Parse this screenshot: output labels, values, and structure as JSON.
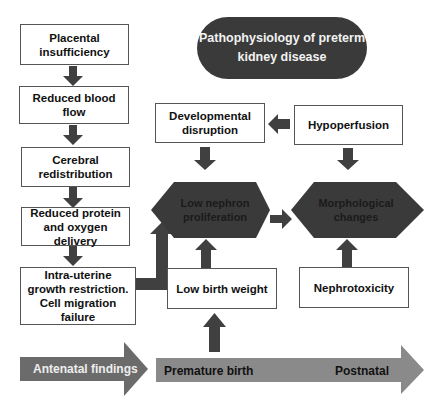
{
  "title": "Pathophysiology of preterm kidney disease",
  "colors": {
    "dark": "#3a3a3a",
    "arrow": "#404040",
    "timeline_antenatal": "#6b6b6b",
    "timeline_postnatal": "#8a8a8a",
    "box_border": "#555555",
    "background": "#ffffff"
  },
  "left_column": [
    {
      "label": "Placental insufficiency"
    },
    {
      "label": "Reduced blood flow"
    },
    {
      "label": "Cerebral redistribution"
    },
    {
      "label": "Reduced protein and oxygen delivery"
    },
    {
      "label": "Intra-uterine growth restriction. Cell migration failure"
    }
  ],
  "right_boxes": {
    "developmental_disruption": "Developmental disruption",
    "hypoperfusion": "Hypoperfusion",
    "low_birth_weight": "Low birth weight",
    "nephrotoxicity": "Nephrotoxicity"
  },
  "hexagons": {
    "low_nephron": "Low nephron proliferation",
    "morphological": "Morphological changes"
  },
  "timeline": {
    "antenatal": "Antenatal findings",
    "premature_birth": "Premature birth",
    "postnatal": "Postnatal"
  }
}
